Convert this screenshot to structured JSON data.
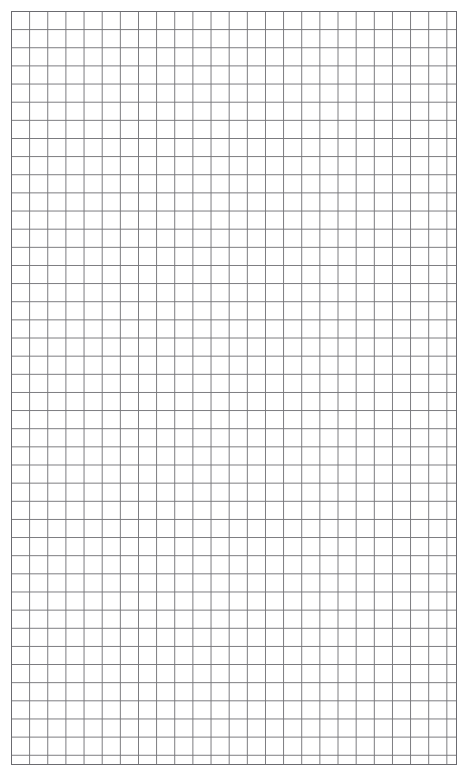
{
  "document": {
    "kind": "graph-paper",
    "title": "Square Ruled Graph Paper",
    "page_width": 469,
    "page_height": 778,
    "background_color": "#ffffff",
    "paper_color": "#ffffff"
  },
  "grid": {
    "type": "square-ruled",
    "line_color": "#76767a",
    "border_color": "#6b6b70",
    "line_width": 1,
    "cell_size": 18.15,
    "columns": 24,
    "rows": 41,
    "origin_x": 11,
    "origin_y": 11,
    "width": 446,
    "height": 754,
    "major_lines": false,
    "labels": false,
    "axis_ticks": false
  },
  "margins": {
    "left": 11,
    "top": 11,
    "right": 12,
    "bottom": 13
  }
}
